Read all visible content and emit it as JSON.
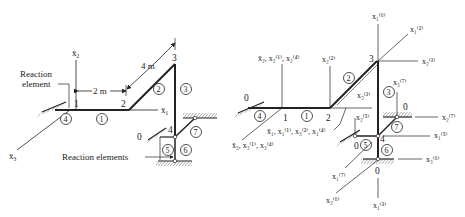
{
  "left_figure": {
    "labels": {
      "reaction_element": [
        "Reaction",
        "element"
      ],
      "reaction_elements": "Reaction elements",
      "dim_2m": "2 m",
      "dim_4m": "4 m",
      "axis_x1": "x̄",
      "axis_x1_sub": "1",
      "axis_x2": "x̄",
      "axis_x2_sub": "2",
      "axis_x3": "x̄",
      "axis_x3_sub": "3",
      "ground_node": "0"
    },
    "nodes": [
      "1",
      "2",
      "3",
      "4"
    ],
    "elements": [
      "1",
      "2",
      "3",
      "4",
      "5",
      "6",
      "7"
    ]
  },
  "right_figure": {
    "nodes": [
      "0",
      "1",
      "2",
      "3",
      "4",
      "0",
      "0",
      "0"
    ],
    "elements": [
      "1",
      "2",
      "3",
      "4",
      "5",
      "6",
      "7"
    ],
    "axis_labels": {
      "global_x2": "x̄₂, x₂⁽¹⁾, x₂⁽⁴⁾",
      "global_x1": "x̄₁, x₁⁽¹⁾, x₃⁽²⁾, x₁⁽⁴⁾",
      "global_x3": "x̄₃, x₃⁽¹⁾, x₃⁽⁴⁾",
      "e2_x2": "x₂⁽²⁾",
      "e3_x2": "x₂⁽³⁾",
      "e3_x3": "x₃⁽³⁾",
      "e2_x1": "x₁⁽²⁾",
      "e6_x1": "x₁⁽⁶⁾",
      "e7_x3": "x₃⁽⁷⁾",
      "e7_x2": "x₂⁽⁷⁾",
      "e5_x2": "x₂⁽⁵⁾",
      "e5_x1": "x₁⁽⁵⁾",
      "e6_x3": "x₃⁽⁶⁾",
      "e7_x1": "x₁⁽⁷⁾",
      "e6_x2": "x₂⁽⁶⁾",
      "e3_x1": "x₁⁽³⁾"
    }
  }
}
